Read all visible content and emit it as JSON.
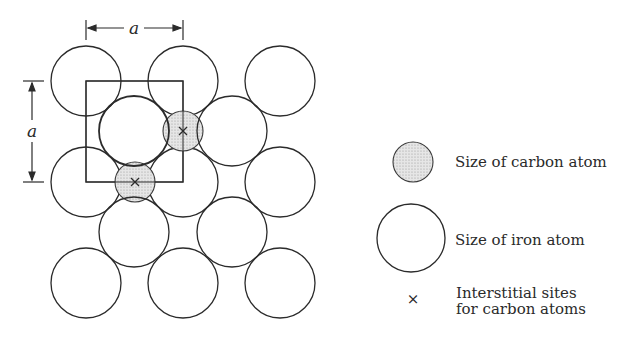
{
  "dimension": {
    "horizontal_label": "a",
    "vertical_label": "a"
  },
  "legend": {
    "carbon": {
      "label": "Size of carbon atom"
    },
    "iron": {
      "label": "Size of iron atom"
    },
    "interstitial": {
      "symbol": "×",
      "label_line1": "Interstitial sites",
      "label_line2": "for carbon atoms"
    }
  },
  "colors": {
    "stroke": "#2b2b2b",
    "carbon_fill": "#d9d9d9",
    "background": "#ffffff"
  },
  "lattice": {
    "cell_size": 97,
    "iron_radius": 35,
    "carbon_radius": 20,
    "corner_atoms": [
      [
        86,
        81
      ],
      [
        183,
        81
      ],
      [
        280,
        81
      ],
      [
        86,
        182
      ],
      [
        183,
        182
      ],
      [
        280,
        182
      ],
      [
        86,
        283
      ],
      [
        183,
        283
      ],
      [
        280,
        283
      ]
    ],
    "center_atoms": [
      [
        134,
        131
      ],
      [
        232,
        131
      ],
      [
        134,
        232
      ],
      [
        232,
        232
      ]
    ],
    "carbon_sites": [
      [
        183,
        131
      ],
      [
        135,
        182
      ]
    ]
  }
}
